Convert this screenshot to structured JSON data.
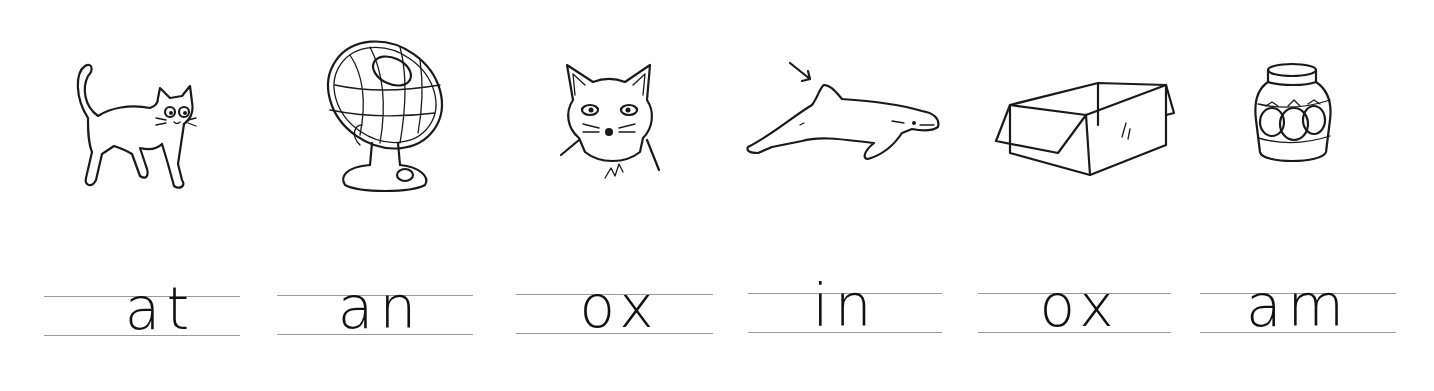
{
  "worksheet": {
    "items": [
      {
        "picture": "cat",
        "word": "at",
        "icon": "cat-icon"
      },
      {
        "picture": "fan",
        "word": "an",
        "icon": "fan-icon"
      },
      {
        "picture": "fox",
        "word": "ox",
        "icon": "fox-icon"
      },
      {
        "picture": "dolphin fin (arrow)",
        "word": "in",
        "icon": "dolphin-fin-icon"
      },
      {
        "picture": "box",
        "word": "ox",
        "icon": "box-icon"
      },
      {
        "picture": "jam jar",
        "word": "am",
        "icon": "jam-jar-icon"
      }
    ]
  },
  "colors": {
    "ink": "#1a1a1a",
    "guide_line": "#9a9a9a",
    "background": "#ffffff"
  }
}
